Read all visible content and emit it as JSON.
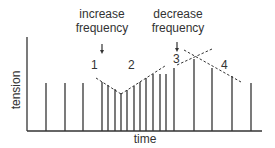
{
  "diagram": {
    "axis_labels": {
      "x": "time",
      "y": "tension"
    },
    "annotations": [
      {
        "id": "increase",
        "line1": "increase",
        "line2": "frequency"
      },
      {
        "id": "decrease",
        "line1": "decrease",
        "line2": "frequency"
      }
    ],
    "phase_labels": [
      "1",
      "2",
      "3",
      "4"
    ],
    "colors": {
      "ink": "#333333",
      "background": "#ffffff"
    },
    "bars": [
      {
        "x": 46,
        "top": 83
      },
      {
        "x": 65,
        "top": 83
      },
      {
        "x": 83,
        "top": 83
      },
      {
        "x": 102,
        "top": 82
      },
      {
        "x": 108,
        "top": 85
      },
      {
        "x": 115,
        "top": 89
      },
      {
        "x": 121,
        "top": 93
      },
      {
        "x": 127,
        "top": 90
      },
      {
        "x": 134,
        "top": 86
      },
      {
        "x": 140,
        "top": 82
      },
      {
        "x": 146,
        "top": 78
      },
      {
        "x": 153,
        "top": 74
      },
      {
        "x": 160,
        "top": 74
      },
      {
        "x": 166,
        "top": 74
      },
      {
        "x": 174,
        "top": 68
      },
      {
        "x": 194,
        "top": 59
      },
      {
        "x": 212,
        "top": 68
      },
      {
        "x": 232,
        "top": 76
      },
      {
        "x": 251,
        "top": 83
      }
    ]
  }
}
